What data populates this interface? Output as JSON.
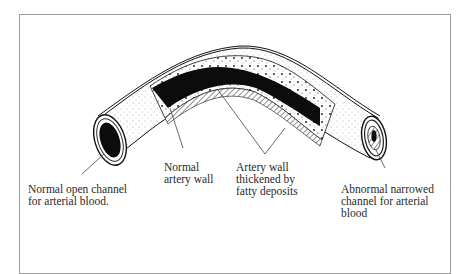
{
  "diagram": {
    "labels": [
      {
        "id": "normal-open-channel",
        "lines": [
          "Normal open channel",
          "for arterial blood."
        ]
      },
      {
        "id": "normal-artery-wall",
        "lines": [
          "Normal",
          "artery wall"
        ]
      },
      {
        "id": "thickened-wall",
        "lines": [
          "Artery wall",
          "thickened by",
          "fatty deposits"
        ]
      },
      {
        "id": "abnormal-narrowed-channel",
        "lines": [
          "Abnormal narrowed",
          "channel for arterial",
          "blood"
        ]
      }
    ],
    "colors": {
      "frame": "#9c9c9c",
      "ink": "#111111",
      "text": "#2a2a2a",
      "background": "#ffffff"
    }
  }
}
